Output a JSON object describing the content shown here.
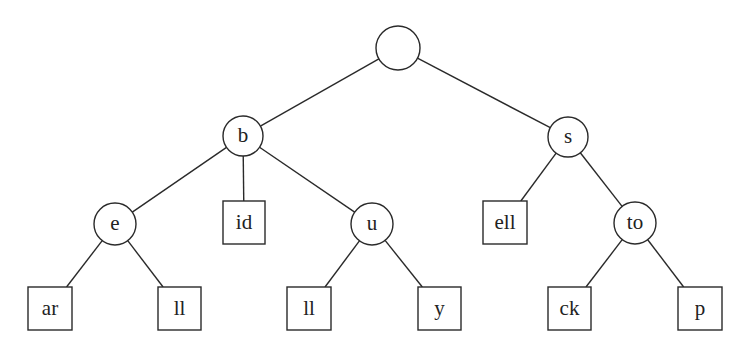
{
  "diagram": {
    "type": "trie",
    "colors": {
      "stroke": "#2a2a2a",
      "text": "#222222",
      "background": "#ffffff"
    },
    "nodes": [
      {
        "id": "root",
        "label": "",
        "shape": "circle",
        "cx": 398,
        "cy": 48,
        "r": 22
      },
      {
        "id": "b",
        "label": "b",
        "shape": "circle",
        "cx": 243,
        "cy": 136,
        "r": 20
      },
      {
        "id": "s",
        "label": "s",
        "shape": "circle",
        "cx": 568,
        "cy": 137,
        "r": 20
      },
      {
        "id": "e",
        "label": "e",
        "shape": "circle",
        "cx": 115,
        "cy": 224,
        "r": 21
      },
      {
        "id": "id",
        "label": "id",
        "shape": "box",
        "x": 223,
        "y": 201,
        "w": 42,
        "h": 43
      },
      {
        "id": "u",
        "label": "u",
        "shape": "circle",
        "cx": 372,
        "cy": 224,
        "r": 21
      },
      {
        "id": "ell",
        "label": "ell",
        "shape": "box",
        "x": 483,
        "y": 201,
        "w": 44,
        "h": 43
      },
      {
        "id": "to",
        "label": "to",
        "shape": "circle",
        "cx": 635,
        "cy": 223,
        "r": 21
      },
      {
        "id": "ar",
        "label": "ar",
        "shape": "box",
        "x": 28,
        "y": 287,
        "w": 44,
        "h": 43
      },
      {
        "id": "ll1",
        "label": "ll",
        "shape": "box",
        "x": 158,
        "y": 287,
        "w": 43,
        "h": 43
      },
      {
        "id": "ll2",
        "label": "ll",
        "shape": "box",
        "x": 287,
        "y": 287,
        "w": 44,
        "h": 43
      },
      {
        "id": "y",
        "label": "y",
        "shape": "box",
        "x": 418,
        "y": 287,
        "w": 43,
        "h": 43
      },
      {
        "id": "ck",
        "label": "ck",
        "shape": "box",
        "x": 548,
        "y": 287,
        "w": 43,
        "h": 43
      },
      {
        "id": "p",
        "label": "p",
        "shape": "box",
        "x": 678,
        "y": 287,
        "w": 44,
        "h": 43
      }
    ],
    "edges": [
      [
        "root",
        "b"
      ],
      [
        "root",
        "s"
      ],
      [
        "b",
        "e"
      ],
      [
        "b",
        "id"
      ],
      [
        "b",
        "u"
      ],
      [
        "s",
        "ell"
      ],
      [
        "s",
        "to"
      ],
      [
        "e",
        "ar"
      ],
      [
        "e",
        "ll1"
      ],
      [
        "u",
        "ll2"
      ],
      [
        "u",
        "y"
      ],
      [
        "to",
        "ck"
      ],
      [
        "to",
        "p"
      ]
    ]
  }
}
